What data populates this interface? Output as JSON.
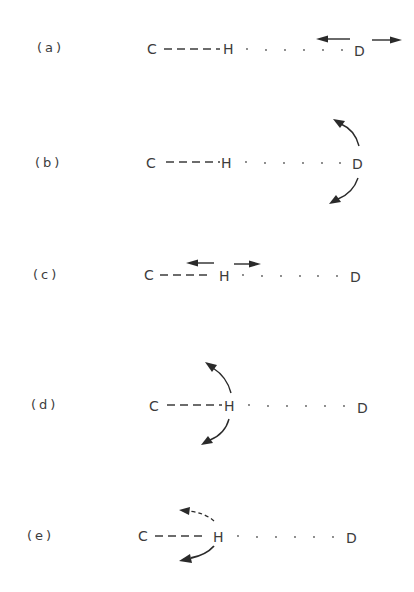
{
  "figure": {
    "rows": [
      {
        "id": "a",
        "label": "(a)",
        "atoms": [
          "C",
          "H",
          "D"
        ],
        "motion": "D stretching (linear arrows on D, pointing away in both directions)"
      },
      {
        "id": "b",
        "label": "(b)",
        "atoms": [
          "C",
          "H",
          "D"
        ],
        "motion": "D bending (curved arrows on D, up and down)"
      },
      {
        "id": "c",
        "label": "(c)",
        "atoms": [
          "C",
          "H",
          "D"
        ],
        "motion": "H stretching (linear arrows on H, left and right)"
      },
      {
        "id": "d",
        "label": "(d)",
        "atoms": [
          "C",
          "H",
          "D"
        ],
        "motion": "H bending (curved arrows on H, up and down)"
      },
      {
        "id": "e",
        "label": "(e)",
        "atoms": [
          "C",
          "H",
          "D"
        ],
        "motion": "H rotation/libration (curved arrows on H, upper dashed, lower solid)"
      }
    ],
    "bond_styles": {
      "C-H": "dashed",
      "H-D": "dotted"
    },
    "colors": {
      "text": "#3c3c3c",
      "arrows": "#2a2a2a",
      "background": "#ffffff"
    }
  }
}
